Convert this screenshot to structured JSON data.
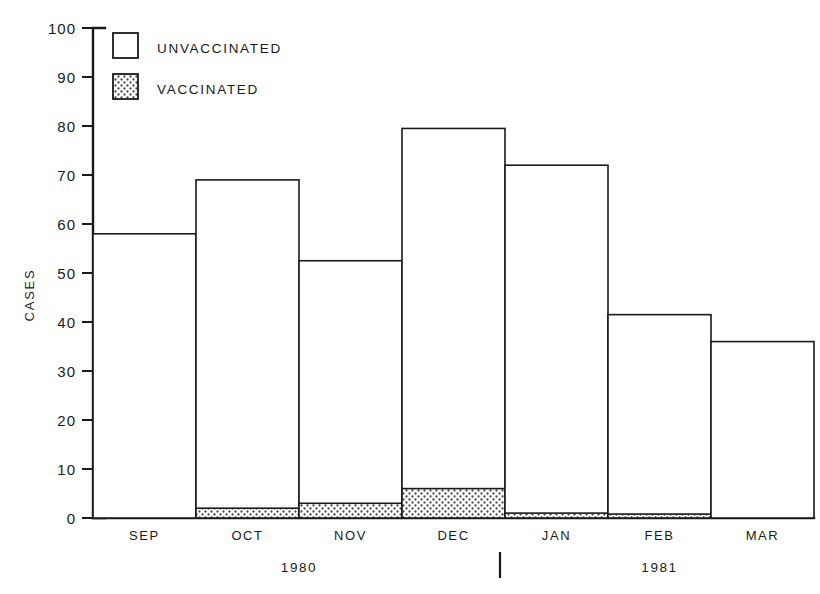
{
  "chart_data": {
    "type": "bar",
    "title": "",
    "subtitle": "",
    "xlabel": "",
    "ylabel": "CASES",
    "ylim": [
      0,
      100
    ],
    "ytick_values": [
      0,
      10,
      20,
      30,
      40,
      50,
      60,
      70,
      80,
      90,
      100
    ],
    "ytick_labels": [
      "0",
      "10",
      "20",
      "30",
      "40",
      "50",
      "60",
      "70",
      "80",
      "90",
      "100"
    ],
    "grid": false,
    "stacked": true,
    "bar_style": "touching-step-outline",
    "legend_position": "upper-left-inside",
    "categories": [
      "SEP",
      "OCT",
      "NOV",
      "DEC",
      "JAN",
      "FEB",
      "MAR"
    ],
    "group_labels": [
      {
        "label": "1980",
        "categories": [
          "SEP",
          "OCT",
          "NOV",
          "DEC"
        ]
      },
      {
        "label": "1981",
        "categories": [
          "JAN",
          "FEB",
          "MAR"
        ]
      }
    ],
    "group_separator_after": "DEC",
    "series": [
      {
        "name": "UNVACCINATED",
        "fill": "white",
        "values": [
          58,
          67,
          49.5,
          73.5,
          71,
          40.7,
          36
        ]
      },
      {
        "name": "VACCINATED",
        "fill": "stippled",
        "values": [
          0,
          2,
          3,
          6,
          1,
          0.8,
          0
        ]
      }
    ],
    "totals": [
      58,
      69,
      52.5,
      79.5,
      72,
      41.5,
      36
    ],
    "annotations": []
  },
  "legend": {
    "items": [
      {
        "label": "UNVACCINATED",
        "swatch": "open-square"
      },
      {
        "label": "VACCINATED",
        "swatch": "dotted-square"
      }
    ]
  },
  "colors": {
    "ink": "#1a1a1a",
    "background": "#ffffff",
    "stipple_dot": "#4a4a4a"
  }
}
